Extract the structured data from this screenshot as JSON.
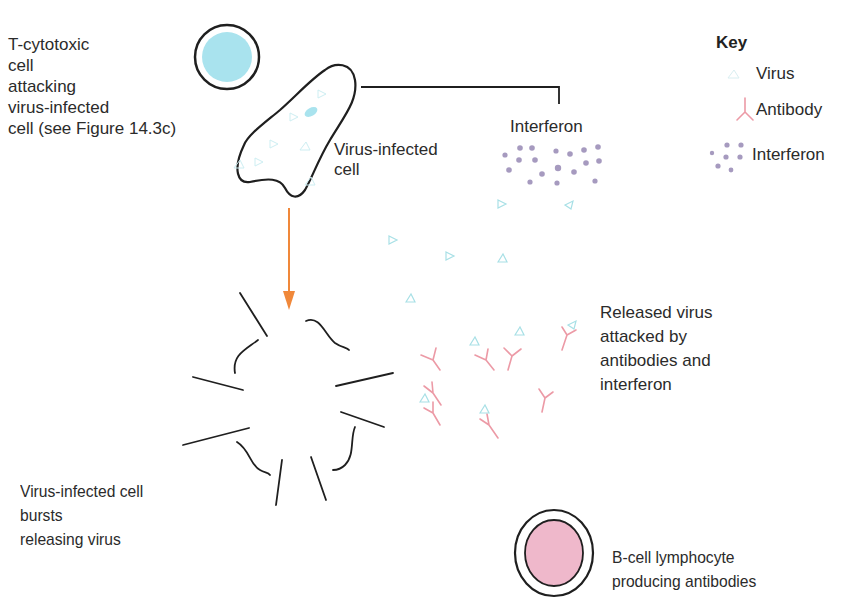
{
  "labels": {
    "t_cell": "T-cytotoxic\ncell\nattacking\nvirus-infected\ncell (see Figure 14.3c)",
    "infected_cell": "Virus-infected\ncell",
    "interferon": "Interferon",
    "released": "Released virus\nattacked by\nantibodies and\ninterferon",
    "burst": "Virus-infected cell\nbursts\nreleasing virus",
    "b_cell": "B-cell lymphocyte\nproducing antibodies"
  },
  "key": {
    "title": "Key",
    "items": [
      {
        "label": "Virus",
        "icon": "virus-icon"
      },
      {
        "label": "Antibody",
        "icon": "antibody-icon"
      },
      {
        "label": "Interferon",
        "icon": "interferon-icon"
      }
    ]
  },
  "colors": {
    "outline": "#1f1f1f",
    "t_cell_fill": "#a9e3ee",
    "b_cell_fill": "#efb8cb",
    "virus": "#a8e0e6",
    "antibody": "#ec9aa6",
    "interferon": "#a69abf",
    "arrow": "#f0883a"
  }
}
